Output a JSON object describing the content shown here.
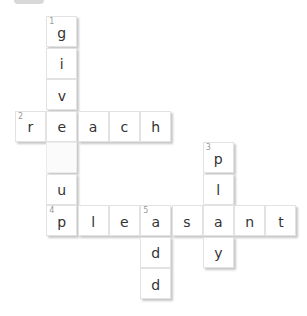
{
  "puzzle": {
    "cell_size": 31,
    "origin_x": 15,
    "origin_y": 16,
    "cells": [
      {
        "row": 0,
        "col": 1,
        "letter": "g",
        "number": "1"
      },
      {
        "row": 1,
        "col": 1,
        "letter": "i"
      },
      {
        "row": 2,
        "col": 1,
        "letter": "v"
      },
      {
        "row": 3,
        "col": 0,
        "letter": "r",
        "number": "2"
      },
      {
        "row": 3,
        "col": 1,
        "letter": "e"
      },
      {
        "row": 3,
        "col": 2,
        "letter": "a"
      },
      {
        "row": 3,
        "col": 3,
        "letter": "c"
      },
      {
        "row": 3,
        "col": 4,
        "letter": "h"
      },
      {
        "row": 4,
        "col": 1,
        "letter": "",
        "space": true
      },
      {
        "row": 4,
        "col": 6,
        "letter": "p",
        "number": "3"
      },
      {
        "row": 5,
        "col": 1,
        "letter": "u"
      },
      {
        "row": 5,
        "col": 6,
        "letter": "l"
      },
      {
        "row": 6,
        "col": 1,
        "letter": "p",
        "number": "4"
      },
      {
        "row": 6,
        "col": 2,
        "letter": "l"
      },
      {
        "row": 6,
        "col": 3,
        "letter": "e"
      },
      {
        "row": 6,
        "col": 4,
        "letter": "a",
        "number": "5"
      },
      {
        "row": 6,
        "col": 5,
        "letter": "s"
      },
      {
        "row": 6,
        "col": 6,
        "letter": "a"
      },
      {
        "row": 6,
        "col": 7,
        "letter": "n"
      },
      {
        "row": 6,
        "col": 8,
        "letter": "t"
      },
      {
        "row": 7,
        "col": 4,
        "letter": "d"
      },
      {
        "row": 7,
        "col": 6,
        "letter": "y"
      },
      {
        "row": 8,
        "col": 4,
        "letter": "d"
      }
    ],
    "words": [
      {
        "number": "1",
        "direction": "down",
        "answer": "give up"
      },
      {
        "number": "2",
        "direction": "across",
        "answer": "reach"
      },
      {
        "number": "3",
        "direction": "down",
        "answer": "ply"
      },
      {
        "number": "4",
        "direction": "across",
        "answer": "pleasant"
      },
      {
        "number": "5",
        "direction": "down",
        "answer": "add"
      }
    ]
  }
}
